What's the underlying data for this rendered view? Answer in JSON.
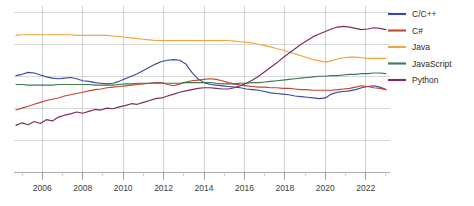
{
  "chart_data": {
    "type": "line",
    "title": "",
    "subtitle": "",
    "xlabel": "",
    "ylabel": "",
    "xlim": [
      2004.6,
      2023.2
    ],
    "ylim": [
      0,
      26
    ],
    "grid": true,
    "legend_position": "right",
    "x_tick_labels": [
      "2006",
      "2008",
      "2010",
      "2012",
      "2014",
      "2016",
      "2018",
      "2020",
      "2022"
    ],
    "x_ticks": [
      2006,
      2008,
      2010,
      2012,
      2014,
      2016,
      2018,
      2020,
      2022
    ],
    "x_minor_ticks": [
      2005,
      2007,
      2009,
      2011,
      2013,
      2015,
      2017,
      2019,
      2021,
      2023
    ],
    "y_gridlines": [
      5,
      10,
      15,
      20,
      25
    ],
    "y_tick_labels": [],
    "x": [
      2004.7,
      2005.0,
      2005.3,
      2005.6,
      2005.9,
      2006.2,
      2006.5,
      2006.8,
      2007.1,
      2007.4,
      2007.7,
      2008.0,
      2008.3,
      2008.6,
      2008.9,
      2009.2,
      2009.5,
      2009.8,
      2010.1,
      2010.4,
      2010.7,
      2011.0,
      2011.3,
      2011.6,
      2011.9,
      2012.2,
      2012.5,
      2012.8,
      2013.1,
      2013.4,
      2013.7,
      2014.0,
      2014.3,
      2014.6,
      2014.9,
      2015.2,
      2015.5,
      2015.8,
      2016.1,
      2016.4,
      2016.7,
      2017.0,
      2017.3,
      2017.6,
      2017.9,
      2018.2,
      2018.5,
      2018.8,
      2019.1,
      2019.4,
      2019.7,
      2020.0,
      2020.3,
      2020.6,
      2020.9,
      2021.2,
      2021.5,
      2021.8,
      2022.1,
      2022.4,
      2022.7,
      2023.0
    ],
    "series": [
      {
        "name": "C/C++",
        "color": "#3b4a9c",
        "values": [
          15.1,
          15.3,
          15.6,
          15.5,
          15.2,
          14.9,
          14.7,
          14.6,
          14.7,
          14.8,
          14.6,
          14.3,
          14.2,
          14.0,
          13.9,
          13.8,
          13.9,
          14.2,
          14.6,
          15.0,
          15.4,
          15.9,
          16.4,
          16.9,
          17.3,
          17.5,
          17.6,
          17.5,
          16.9,
          15.6,
          14.6,
          14.0,
          13.7,
          13.6,
          13.5,
          13.4,
          13.3,
          13.2,
          13.0,
          12.9,
          12.8,
          12.6,
          12.4,
          12.3,
          12.2,
          12.1,
          11.9,
          11.8,
          11.7,
          11.6,
          11.5,
          11.6,
          12.2,
          12.5,
          12.6,
          12.7,
          12.9,
          13.2,
          13.4,
          13.5,
          13.3,
          12.9
        ],
        "marker": "none"
      },
      {
        "name": "C#",
        "color": "#c7442e",
        "values": [
          9.7,
          10.0,
          10.3,
          10.6,
          10.9,
          11.2,
          11.4,
          11.6,
          11.9,
          12.1,
          12.3,
          12.5,
          12.7,
          12.9,
          13.0,
          13.2,
          13.3,
          13.4,
          13.5,
          13.6,
          13.7,
          13.8,
          13.9,
          14.0,
          14.0,
          13.7,
          13.5,
          13.8,
          14.1,
          14.3,
          14.4,
          14.5,
          14.6,
          14.5,
          14.3,
          14.0,
          13.8,
          13.6,
          13.5,
          13.4,
          13.3,
          13.3,
          13.2,
          13.2,
          13.1,
          13.1,
          13.0,
          12.9,
          12.9,
          12.8,
          12.8,
          12.8,
          12.8,
          12.9,
          13.0,
          13.1,
          13.3,
          13.5,
          13.4,
          13.2,
          13.1,
          12.9
        ],
        "marker": "none"
      },
      {
        "name": "Java",
        "color": "#f0a63c",
        "values": [
          21.4,
          21.5,
          21.5,
          21.5,
          21.5,
          21.5,
          21.5,
          21.5,
          21.5,
          21.5,
          21.4,
          21.4,
          21.4,
          21.4,
          21.4,
          21.4,
          21.3,
          21.2,
          21.1,
          21.0,
          20.9,
          20.8,
          20.7,
          20.6,
          20.6,
          20.6,
          20.6,
          20.6,
          20.6,
          20.6,
          20.6,
          20.6,
          20.6,
          20.6,
          20.6,
          20.6,
          20.5,
          20.4,
          20.3,
          20.2,
          20.0,
          19.8,
          19.6,
          19.3,
          19.1,
          18.8,
          18.5,
          18.2,
          17.9,
          17.6,
          17.4,
          17.2,
          17.4,
          17.7,
          17.9,
          18.0,
          18.0,
          17.9,
          17.8,
          17.8,
          17.8,
          17.8
        ],
        "marker": "none"
      },
      {
        "name": "JavaScript",
        "color": "#3f7a4e",
        "values": [
          13.7,
          13.7,
          13.6,
          13.6,
          13.6,
          13.6,
          13.6,
          13.7,
          13.7,
          13.7,
          13.7,
          13.7,
          13.7,
          13.6,
          13.6,
          13.6,
          13.6,
          13.7,
          13.8,
          13.8,
          13.9,
          13.9,
          13.9,
          13.9,
          13.9,
          13.9,
          13.9,
          13.9,
          14.0,
          14.0,
          14.0,
          14.0,
          14.0,
          13.9,
          13.8,
          13.8,
          13.8,
          13.9,
          13.9,
          14.0,
          14.0,
          14.1,
          14.2,
          14.3,
          14.4,
          14.5,
          14.6,
          14.7,
          14.8,
          14.9,
          15.0,
          15.0,
          15.1,
          15.1,
          15.2,
          15.3,
          15.3,
          15.4,
          15.4,
          15.5,
          15.5,
          15.4
        ],
        "marker": "none"
      },
      {
        "name": "Python",
        "color": "#7b2d5e",
        "values": [
          7.3,
          7.7,
          7.4,
          7.9,
          7.6,
          8.2,
          8.0,
          8.6,
          8.9,
          9.1,
          9.4,
          9.2,
          9.5,
          9.8,
          9.7,
          10.0,
          9.9,
          10.2,
          10.4,
          10.7,
          10.6,
          10.9,
          11.2,
          11.5,
          11.6,
          11.9,
          12.2,
          12.5,
          12.7,
          12.9,
          13.1,
          13.2,
          13.2,
          13.1,
          13.0,
          13.0,
          13.2,
          13.5,
          13.9,
          14.4,
          15.0,
          15.7,
          16.4,
          17.1,
          17.9,
          18.6,
          19.3,
          20.0,
          20.6,
          21.2,
          21.6,
          22.0,
          22.4,
          22.7,
          22.8,
          22.7,
          22.5,
          22.3,
          22.4,
          22.6,
          22.5,
          22.3
        ],
        "marker": "none"
      }
    ]
  },
  "legend": {
    "items": [
      {
        "label": "C/C++",
        "color": "#3b4a9c"
      },
      {
        "label": "C#",
        "color": "#c7442e"
      },
      {
        "label": "Java",
        "color": "#f0a63c"
      },
      {
        "label": "JavaScript",
        "color": "#3f7a4e"
      },
      {
        "label": "Python",
        "color": "#7b2d5e"
      }
    ]
  },
  "axis": {
    "x_labels": [
      "2006",
      "2008",
      "2010",
      "2012",
      "2014",
      "2016",
      "2018",
      "2020",
      "2022"
    ]
  }
}
